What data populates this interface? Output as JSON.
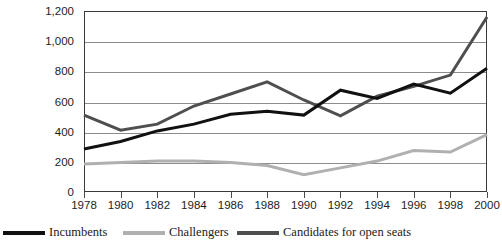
{
  "chart_data": {
    "type": "line",
    "title": "",
    "subtitle": "",
    "xlabel": "",
    "ylabel": "",
    "categories": [
      1978,
      1980,
      1982,
      1984,
      1986,
      1988,
      1990,
      1992,
      1994,
      1996,
      1998,
      2000
    ],
    "xtick_labels": [
      "1978",
      "1980",
      "1982",
      "1984",
      "1986",
      "1988",
      "1990",
      "1992",
      "1994",
      "1996",
      "1998",
      "2000"
    ],
    "ytick_labels": [
      "0",
      "200",
      "400",
      "600",
      "800",
      "1,000",
      "1,200"
    ],
    "ytick_values": [
      0,
      200,
      400,
      600,
      800,
      1000,
      1200
    ],
    "ylim": [
      0,
      1200
    ],
    "xlim": [
      1978,
      2000
    ],
    "grid": "horizontal",
    "legend_position": "bottom",
    "series": [
      {
        "name": "Incumbents",
        "color": "#111111",
        "width": 3.0,
        "values": [
          285,
          335,
          405,
          450,
          515,
          535,
          510,
          675,
          620,
          715,
          655,
          820
        ]
      },
      {
        "name": "Challengers",
        "color": "#b0b0b0",
        "width": 3.0,
        "values": [
          185,
          195,
          205,
          205,
          195,
          175,
          115,
          160,
          205,
          275,
          265,
          380
        ]
      },
      {
        "name": "Candidates for open seats",
        "color": "#4f4f4f",
        "width": 3.0,
        "values": [
          510,
          410,
          450,
          570,
          650,
          730,
          610,
          505,
          635,
          700,
          775,
          1160
        ]
      }
    ]
  },
  "legend": {
    "items": [
      {
        "label": "Incumbents",
        "color": "#111111"
      },
      {
        "label": "Challengers",
        "color": "#b0b0b0"
      },
      {
        "label": "Candidates for open seats",
        "color": "#4f4f4f"
      }
    ]
  },
  "axis": {
    "frame_color": "#3a3a3a",
    "gridline_color": "#8c8c8c"
  }
}
